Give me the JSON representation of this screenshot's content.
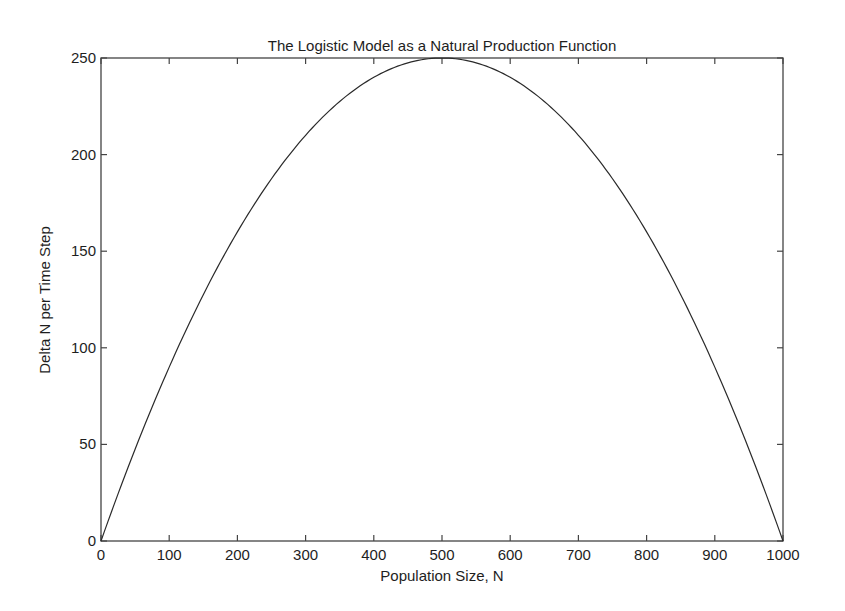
{
  "chart_data": {
    "type": "line",
    "title": "The Logistic Model as a Natural Production Function",
    "xlabel": "Population Size, N",
    "ylabel": "Delta N per Time Step",
    "xlim": [
      0,
      1000
    ],
    "ylim": [
      0,
      250
    ],
    "xticks": [
      0,
      100,
      200,
      300,
      400,
      500,
      600,
      700,
      800,
      900,
      1000
    ],
    "yticks": [
      0,
      50,
      100,
      150,
      200,
      250
    ],
    "grid": false,
    "legend": null,
    "series": [
      {
        "name": "Delta N = N(1 - N/1000)",
        "color": "#2a2a2a",
        "x": [
          0,
          50,
          100,
          150,
          200,
          250,
          300,
          350,
          400,
          450,
          500,
          550,
          600,
          650,
          700,
          750,
          800,
          850,
          900,
          950,
          1000
        ],
        "y": [
          0,
          47.5,
          90,
          127.5,
          160,
          187.5,
          210,
          227.5,
          240,
          247.5,
          250,
          247.5,
          240,
          227.5,
          210,
          187.5,
          160,
          127.5,
          90,
          47.5,
          0
        ]
      }
    ],
    "annotations": []
  },
  "layout": {
    "plot_left": 101,
    "plot_right": 783,
    "plot_top": 58,
    "plot_bottom": 541
  }
}
